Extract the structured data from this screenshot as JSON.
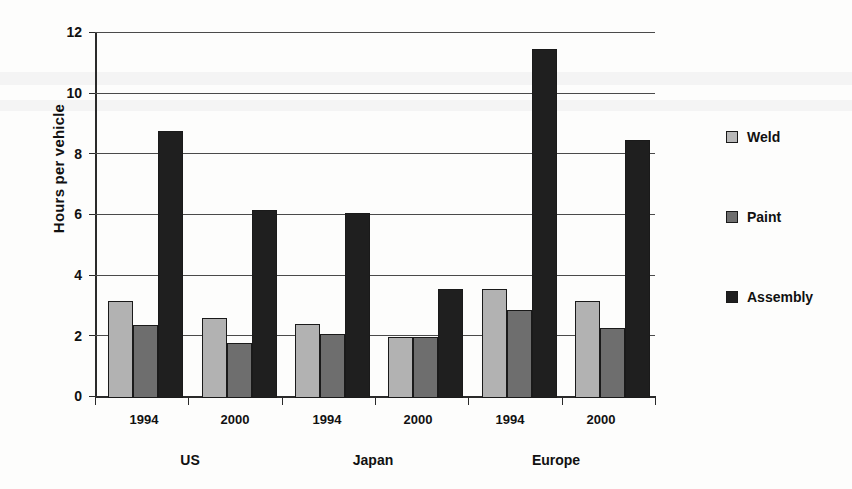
{
  "chart_data": {
    "type": "bar",
    "title": "",
    "xlabel": "",
    "ylabel": "Hours per vehicle",
    "ylim": [
      0,
      12
    ],
    "yticks": [
      "0",
      "2",
      "4",
      "6",
      "8",
      "10",
      "12"
    ],
    "grid": true,
    "legend_position": "right",
    "categories": [
      "1994",
      "2000",
      "1994",
      "2000",
      "1994",
      "2000"
    ],
    "groups": [
      {
        "region": "US",
        "years": [
          "1994",
          "2000"
        ]
      },
      {
        "region": "Japan",
        "years": [
          "1994",
          "2000"
        ]
      },
      {
        "region": "Europe",
        "years": [
          "1994",
          "2000"
        ]
      }
    ],
    "region_labels": [
      "US",
      "Japan",
      "Europe"
    ],
    "series": [
      {
        "name": "Weld",
        "color": "#b2b2b2",
        "values": [
          3.2,
          2.65,
          2.45,
          2.0,
          3.6,
          3.2
        ]
      },
      {
        "name": "Paint",
        "color": "#6e6e6e",
        "values": [
          2.4,
          1.8,
          2.1,
          2.0,
          2.9,
          2.3
        ]
      },
      {
        "name": "Assembly",
        "color": "#1f1f1f",
        "values": [
          8.8,
          6.2,
          6.1,
          3.6,
          11.5,
          8.5
        ]
      }
    ]
  },
  "axis": {
    "y_title": "Hours per vehicle",
    "y_ticks": [
      "12",
      "10",
      "8",
      "6",
      "4",
      "2",
      "0"
    ],
    "x_years": [
      "1994",
      "2000",
      "1994",
      "2000",
      "1994",
      "2000"
    ],
    "x_regions": [
      "US",
      "Japan",
      "Europe"
    ]
  },
  "legend": {
    "items": [
      {
        "label": "Weld",
        "swatch": "weld-swatch"
      },
      {
        "label": "Paint",
        "swatch": "paint-swatch"
      },
      {
        "label": "Assembly",
        "swatch": "assembly-swatch"
      }
    ]
  }
}
